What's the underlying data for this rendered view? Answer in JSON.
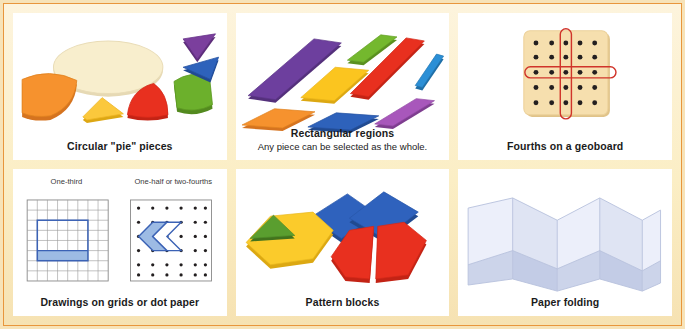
{
  "figure": {
    "frame_border_color": "#e8963c",
    "frame_band_color": "#fbeec5",
    "panel_background": "#ffffff"
  },
  "panels": [
    {
      "id": "circular-pie-pieces",
      "caption": "Circular \"pie\" pieces",
      "subcaption": "",
      "artwork": "circular-pie-pieces-art",
      "pieces": [
        {
          "name": "whole-circle",
          "color": "#f7ecc8",
          "fraction": "1 whole"
        },
        {
          "name": "half-piece",
          "color": "#f59230",
          "fraction": "one-half"
        },
        {
          "name": "eighth-piece",
          "color": "#fbc83c",
          "fraction": "one-eighth"
        },
        {
          "name": "fourth-piece",
          "color": "#e8301f",
          "fraction": "one-fourth"
        },
        {
          "name": "third-piece",
          "color": "#6cb02c",
          "fraction": "one-third"
        },
        {
          "name": "twelfth-piece",
          "color": "#7b3f9d",
          "fraction": "one-twelfth"
        },
        {
          "name": "tenth-piece",
          "color": "#2e62bb",
          "fraction": "one-tenth"
        }
      ]
    },
    {
      "id": "rectangular-regions",
      "caption": "Rectangular regions",
      "subcaption": "Any piece can be selected as the whole.",
      "artwork": "rectangular-regions-art",
      "pieces": [
        {
          "name": "bar-purple-large",
          "color": "#6d3f9e"
        },
        {
          "name": "bar-green",
          "color": "#74b82e"
        },
        {
          "name": "bar-red-long",
          "color": "#e8301f"
        },
        {
          "name": "bar-blue-thin",
          "color": "#2b8fd6"
        },
        {
          "name": "bar-yellow",
          "color": "#fbc51f"
        },
        {
          "name": "bar-orange",
          "color": "#f59230"
        },
        {
          "name": "bar-blue",
          "color": "#2e62bb"
        },
        {
          "name": "bar-violet",
          "color": "#a857bb"
        }
      ]
    },
    {
      "id": "fourths-on-a-geoboard",
      "caption": "Fourths on a geoboard",
      "subcaption": "",
      "artwork": "geoboard-art",
      "board": {
        "rows": 5,
        "columns": 5,
        "board_color": "#f6dfae",
        "peg_color": "#231f20",
        "band_color": "#d0342a",
        "bands": [
          "horizontal-middle-row",
          "vertical-middle-column"
        ]
      }
    },
    {
      "id": "drawings-on-grids-or-dot-paper",
      "caption": "Drawings on grids or dot paper",
      "subcaption": "",
      "artwork": "grid-and-dot-paper-art",
      "mini_labels": [
        "One-third",
        "One-half or two-fourths"
      ],
      "grid_drawing": {
        "columns": 8,
        "rows": 8,
        "grid_line_color": "#8a8a8a",
        "shape_outline_color": "#3b62b5",
        "shape_fill_color": "#9dbbe4",
        "shaded_parts": 1,
        "total_parts": 3
      },
      "dot_drawing": {
        "columns": 6,
        "rows": 6,
        "dot_color": "#231f20",
        "shape_outline_color": "#3b62b5",
        "shape_fill_color": "#9dbbe4",
        "shaded_parts": 1,
        "total_parts": 2
      }
    },
    {
      "id": "pattern-blocks",
      "caption": "Pattern blocks",
      "subcaption": "",
      "artwork": "pattern-blocks-art",
      "pieces": [
        {
          "name": "hexagon-yellow",
          "color": "#fbcb2b"
        },
        {
          "name": "triangle-green",
          "color": "#5a9e2f"
        },
        {
          "name": "rhombus-blue-left",
          "color": "#2f62bd"
        },
        {
          "name": "rhombus-blue-right",
          "color": "#2f62bd"
        },
        {
          "name": "trapezoid-red-left",
          "color": "#e8301f"
        },
        {
          "name": "trapezoid-red-right",
          "color": "#e8301f"
        }
      ]
    },
    {
      "id": "paper-folding",
      "caption": "Paper folding",
      "subcaption": "",
      "artwork": "paper-folding-art",
      "paper": {
        "folds": 4,
        "light_face_color": "#eceffa",
        "shadow_face_color": "#dfe4f3",
        "lower_band_color": "#ccd4ea",
        "edge_color": "#b8c1dd"
      }
    }
  ]
}
